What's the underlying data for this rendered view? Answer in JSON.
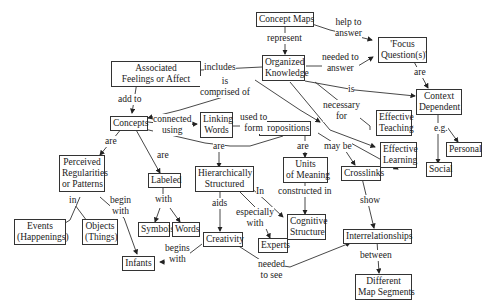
{
  "concept_map": {
    "nodes": {
      "concept_maps": "Concept Maps",
      "focus_q1": "'Focus",
      "focus_q2": "Question(s)'",
      "organized1": "Organized",
      "organized2": "Knowledge",
      "feelings1": "Associated",
      "feelings2": "Feelings or Affect",
      "context1": "Context",
      "context2": "Dependent",
      "concepts": "Concepts",
      "linking1": "Linking",
      "linking2": "Words",
      "propositions": "Propositions",
      "eteach1": "Effective",
      "eteach2": "Teaching",
      "elearn1": "Effective",
      "elearn2": "Learning",
      "personal": "Personal",
      "social": "Social",
      "perceived1": "Perceived",
      "perceived2": "Regularities",
      "perceived3": "or Patterns",
      "labeled": "Labeled",
      "hier1": "Hierarchically",
      "hier2": "Structured",
      "units1": "Units",
      "units2": "of Meaning",
      "crosslinks": "Crosslinks",
      "events1": "Events",
      "events2": "(Happenings)",
      "objects1": "Objects",
      "objects2": "(Things)",
      "symbols": "Symbols",
      "words": "Words",
      "cognitive1": "Cognitive",
      "cognitive2": "Structure",
      "experts": "Experts",
      "creativity": "Creativity",
      "infants": "Infants",
      "interrel": "Interrelationships",
      "diffmap1": "Different",
      "diffmap2": "Map Segments"
    },
    "links": {
      "represent": "represent",
      "help1": "help to",
      "help2": "answer",
      "needed1": "needed to",
      "needed2": "answer",
      "are_focus": "are",
      "includes": "includes",
      "is_ctx": "is",
      "comprised1": "is",
      "comprised2": "comprised of",
      "add_to": "add to",
      "necessary1": "necessary",
      "necessary2": "for",
      "eg": "e.g.",
      "connected1": "connected",
      "connected2": "using",
      "usedto1": "used to",
      "usedto2": "form",
      "are_concepts_perc": "are",
      "are_concepts_lab": "are",
      "are_hier": "are",
      "are_units": "are",
      "may_be": "may be",
      "in": "in",
      "begin1": "begin",
      "begin2": "with",
      "with": "with",
      "aids": "aids",
      "in_cog": "In",
      "especially1": "especially",
      "especially2": "with",
      "constructed": "constructed in",
      "show": "show",
      "begins1": "begins",
      "begins2": "with",
      "needed_see1": "needed",
      "needed_see2": "to see",
      "between": "between"
    }
  }
}
